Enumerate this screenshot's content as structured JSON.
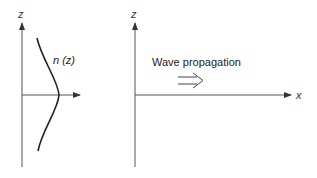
{
  "left_panel": {
    "z_axis_label": "z",
    "curve_label": "n (z)"
  },
  "right_panel": {
    "z_axis_label": "z",
    "x_axis_label": "x",
    "annotation": "Wave propagation"
  },
  "colors": {
    "line": "#333333",
    "background": "#ffffff"
  }
}
